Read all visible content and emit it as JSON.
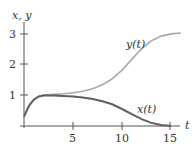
{
  "chart_data": {
    "type": "line",
    "title": "",
    "xlabel": "t",
    "ylabel": "x, y",
    "xlim": [
      0,
      16.5
    ],
    "ylim": [
      0,
      3.3
    ],
    "xticks": [
      5,
      10,
      15
    ],
    "yticks": [
      1,
      2,
      3
    ],
    "grid": false,
    "legend": "inline labels",
    "series": [
      {
        "name": "y(t)",
        "color": "#a8a8a8",
        "x": [
          0,
          0.5,
          1,
          1.5,
          2,
          3,
          4,
          5,
          6,
          7,
          8,
          9,
          10,
          11,
          12,
          13,
          14,
          15,
          16
        ],
        "values": [
          0.3,
          0.65,
          0.85,
          0.95,
          1.0,
          1.02,
          1.04,
          1.07,
          1.12,
          1.2,
          1.33,
          1.52,
          1.8,
          2.15,
          2.5,
          2.75,
          2.9,
          2.97,
          3.0
        ]
      },
      {
        "name": "x(t)",
        "color": "#606060",
        "x": [
          0,
          0.5,
          1,
          1.5,
          2,
          3,
          4,
          5,
          6,
          7,
          8,
          9,
          10,
          11,
          12,
          13,
          14,
          15
        ],
        "values": [
          0.3,
          0.65,
          0.85,
          0.95,
          0.98,
          0.98,
          0.97,
          0.95,
          0.92,
          0.87,
          0.8,
          0.7,
          0.55,
          0.38,
          0.22,
          0.1,
          0.03,
          0.0
        ]
      }
    ]
  },
  "labels": {
    "y_axis": "x, y",
    "x_axis": "t",
    "y_curve": "y(t)",
    "x_curve": "x(t)",
    "tick_x_5": "5",
    "tick_x_10": "10",
    "tick_x_15": "15",
    "tick_y_1": "1",
    "tick_y_2": "2",
    "tick_y_3": "3"
  }
}
